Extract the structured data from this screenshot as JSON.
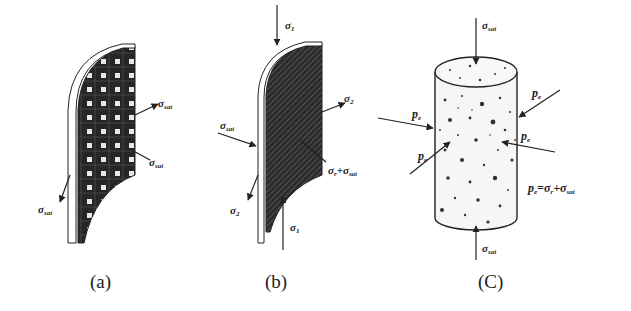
{
  "figure": {
    "panels": [
      {
        "id": "a",
        "caption": "(a)",
        "description": "Membrane with saturated fabric pattern",
        "labels": [
          {
            "name": "sigma-sat-right-upper",
            "symbol": "σ",
            "sub": "sat"
          },
          {
            "name": "sigma-sat-right-lower",
            "symbol": "σ",
            "sub": "sat"
          },
          {
            "name": "sigma-sat-left",
            "symbol": "σ",
            "sub": "sat"
          }
        ]
      },
      {
        "id": "b",
        "caption": "(b)",
        "description": "Membrane with hatched section under principal stresses",
        "labels": [
          {
            "name": "sigma-1-top",
            "symbol": "σ",
            "sub": "1"
          },
          {
            "name": "sigma-2-right",
            "symbol": "σ",
            "sub": "2"
          },
          {
            "name": "sigma-sat-left",
            "symbol": "σ",
            "sub": "sat"
          },
          {
            "name": "sigma-r-plus-sat",
            "symbol": "σ",
            "sub": "r",
            "extra": "+σ",
            "extra_sub": "sat"
          },
          {
            "name": "sigma-2-left",
            "symbol": "σ",
            "sub": "2"
          },
          {
            "name": "sigma-1-bottom",
            "symbol": "σ",
            "sub": "1"
          }
        ]
      },
      {
        "id": "c",
        "caption": "(C)",
        "description": "Cylindrical soil specimen under effective confining pressure",
        "labels": [
          {
            "name": "sigma-sat-top",
            "symbol": "σ",
            "sub": "sat"
          },
          {
            "name": "pe-right-upper",
            "symbol": "p",
            "sub": "e"
          },
          {
            "name": "pe-left-upper",
            "symbol": "p",
            "sub": "e"
          },
          {
            "name": "pe-right-mid",
            "symbol": "p",
            "sub": "e"
          },
          {
            "name": "pe-left-lower",
            "symbol": "p",
            "sub": "e"
          },
          {
            "name": "sigma-sat-bottom",
            "symbol": "σ",
            "sub": "sat"
          }
        ],
        "equation": {
          "lhs": "p",
          "lhs_sub": "e",
          "eq": "=",
          "t1": "σ",
          "t1_sub": "r",
          "plus": "+",
          "t2": "σ",
          "t2_sub": "sat"
        }
      }
    ],
    "colors": {
      "ink": "#222222",
      "fill_dark": "#2a2a2a",
      "background": "#ffffff"
    }
  }
}
